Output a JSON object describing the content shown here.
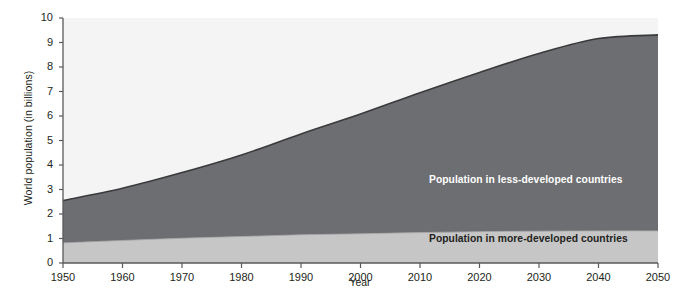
{
  "chart_data": {
    "type": "area",
    "title": "",
    "subtitle": "",
    "xlabel": "Year",
    "ylabel": "World population (in billions)",
    "xlim": [
      1950,
      2050
    ],
    "ylim": [
      0,
      10
    ],
    "grid": false,
    "stacked": true,
    "legend_position": "inline-labels",
    "x": [
      1950,
      1960,
      1970,
      1980,
      1990,
      2000,
      2010,
      2020,
      2030,
      2040,
      2050
    ],
    "series": [
      {
        "name": "Population in more-developed countries",
        "color": "#c6c6c6",
        "values": [
          0.82,
          0.92,
          1.01,
          1.08,
          1.15,
          1.19,
          1.24,
          1.28,
          1.3,
          1.31,
          1.31
        ]
      },
      {
        "name": "Population in less-developed countries",
        "color": "#6d6e71",
        "values": [
          1.73,
          2.13,
          2.68,
          3.33,
          4.12,
          4.89,
          5.71,
          6.5,
          7.25,
          7.85,
          8.0
        ]
      }
    ],
    "totals": [
      2.55,
      3.05,
      3.69,
      4.41,
      5.27,
      6.08,
      6.95,
      7.78,
      8.55,
      9.16,
      9.31
    ],
    "ticks": {
      "y": [
        "0",
        "1",
        "2",
        "3",
        "4",
        "5",
        "6",
        "7",
        "8",
        "9",
        "10"
      ],
      "x": [
        "1950",
        "1960",
        "1970",
        "1980",
        "1990",
        "2000",
        "2010",
        "2020",
        "2030",
        "2040",
        "2050"
      ]
    },
    "annotations": [
      {
        "text": "Population in less-developed countries",
        "x": 2022,
        "y": 3.2
      },
      {
        "text": "Population in more-developed countries",
        "x": 2022,
        "y": 0.55
      }
    ],
    "colors": {
      "upper_band": "#6d6e71",
      "lower_band": "#c6c6c6",
      "plot_background": "#f4f4f4",
      "axis": "#58595b",
      "curve_outline": "#3a3a3c",
      "text": "#231f20"
    }
  }
}
